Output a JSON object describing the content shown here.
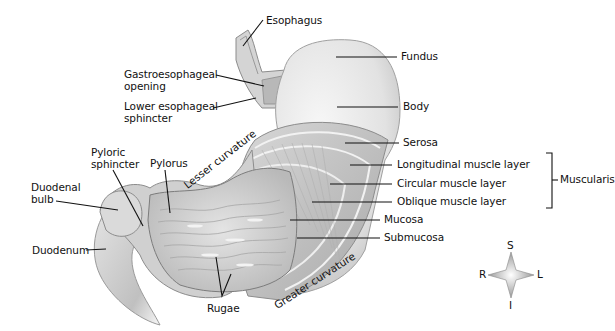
{
  "diagram": {
    "labels": {
      "esophagus": "Esophagus",
      "fundus": "Fundus",
      "gastroesophageal_opening": "Gastroesophageal opening",
      "lower_esophageal_sphincter": "Lower esophageal sphincter",
      "body": "Body",
      "serosa": "Serosa",
      "longitudinal_muscle_layer": "Longitudinal muscle layer",
      "circular_muscle_layer": "Circular muscle layer",
      "oblique_muscle_layer": "Oblique muscle layer",
      "muscularis": "Muscularis",
      "mucosa": "Mucosa",
      "submucosa": "Submucosa",
      "pyloric_sphincter": "Pyloric sphincter",
      "pylorus": "Pylorus",
      "duodenal_bulb": "Duodenal bulb",
      "duodenum": "Duodenum",
      "lesser_curvature": "Lesser curvature",
      "greater_curvature": "Greater curvature",
      "rugae": "Rugae"
    },
    "compass": {
      "superior": "S",
      "inferior": "I",
      "right": "R",
      "left": "L"
    },
    "colors": {
      "background": "#ffffff",
      "tissue_light": "#e9e9e9",
      "tissue_mid": "#c8c8c8",
      "tissue_dark": "#9a9a9a",
      "leader_line": "#111111"
    }
  }
}
